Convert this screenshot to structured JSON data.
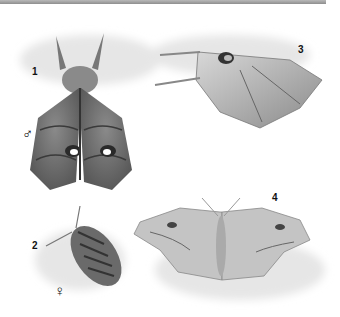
{
  "plate": {
    "specimens": [
      {
        "number": "1",
        "sex_symbol": "♂"
      },
      {
        "number": "2",
        "sex_symbol": "♀"
      },
      {
        "number": "3"
      },
      {
        "number": "4"
      }
    ]
  },
  "colors": {
    "top_border": "#9a9a9a",
    "moth_dark": "#5e5e5e",
    "moth_light": "#bdbdbd",
    "shadow": "#e6e6e6"
  }
}
